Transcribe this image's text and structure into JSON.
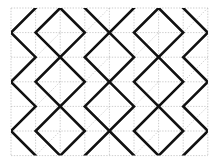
{
  "figure": {
    "title": "",
    "type": "geometric-tiling-pattern",
    "canvas": {
      "width": 217,
      "height": 164,
      "background": "#ffffff"
    },
    "grid": {
      "origin_x": 11,
      "origin_y": 8,
      "cell": 24.6,
      "cols": 8,
      "rows": 6,
      "line_color": "#b8b8b8",
      "line_width": 0.7,
      "dash": "1.4,1.4",
      "grid_visible": true
    },
    "diagonals": {
      "color": "#bdbdbd",
      "line_width": 0.7,
      "dash": "1.4,1.4",
      "cells_with_x": [
        [
          3,
          0
        ],
        [
          7,
          0
        ],
        [
          1,
          1
        ],
        [
          5,
          1
        ],
        [
          3,
          2
        ],
        [
          7,
          2
        ],
        [
          1,
          3
        ],
        [
          5,
          3
        ],
        [
          3,
          4
        ],
        [
          7,
          4
        ],
        [
          1,
          5
        ],
        [
          5,
          5
        ]
      ]
    },
    "diamonds": {
      "color": "#111111",
      "line_width": 2.6,
      "note": "bold rotated squares; each centered on a grid vertex, half-diagonal = 1 cell",
      "centers_cells": [
        [
          2,
          1
        ],
        [
          6,
          1
        ],
        [
          4,
          2
        ],
        [
          8,
          2
        ],
        [
          0,
          2
        ],
        [
          2,
          3
        ],
        [
          6,
          3
        ],
        [
          4,
          4
        ],
        [
          8,
          4
        ],
        [
          0,
          4
        ],
        [
          2,
          5
        ],
        [
          6,
          5
        ],
        [
          4,
          0
        ],
        [
          0,
          0
        ],
        [
          8,
          0
        ],
        [
          4,
          6
        ],
        [
          0,
          6
        ],
        [
          8,
          6
        ],
        [
          2,
          -1
        ],
        [
          6,
          -1
        ]
      ]
    }
  },
  "chart_data": {
    "type": "scatter",
    "xlabel": "",
    "ylabel": "",
    "xlim": [
      0,
      8
    ],
    "ylim": [
      0,
      6
    ],
    "grid": true,
    "legend_position": "none",
    "series": [
      {
        "name": "bold diamond centers (grid units)",
        "x": [
          2,
          6,
          4,
          8,
          0,
          2,
          6,
          4,
          8,
          0,
          2,
          6,
          4,
          0,
          8,
          4,
          0,
          8,
          2,
          6
        ],
        "y": [
          1,
          1,
          2,
          2,
          2,
          3,
          3,
          4,
          4,
          4,
          5,
          5,
          0,
          0,
          0,
          6,
          6,
          6,
          -1,
          -1
        ]
      },
      {
        "name": "x-marked cells (col,row index)",
        "x": [
          3,
          7,
          1,
          5,
          3,
          7,
          1,
          5,
          3,
          7,
          1,
          5
        ],
        "y": [
          0,
          0,
          1,
          1,
          2,
          2,
          3,
          3,
          4,
          4,
          5,
          5
        ]
      }
    ]
  }
}
